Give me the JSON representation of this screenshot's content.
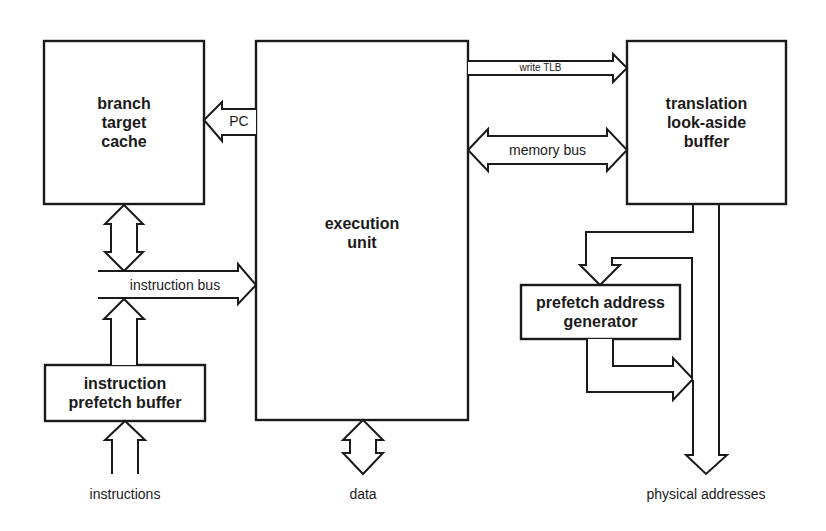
{
  "diagram": {
    "type": "block-diagram",
    "blocks": {
      "branch_target_cache": "branch\ntarget\ncache",
      "branch_target_cache_lines": [
        "branch",
        "target",
        "cache"
      ],
      "execution_unit_lines": [
        "execution",
        "unit"
      ],
      "tlb_lines": [
        "translation",
        "look-aside",
        "buffer"
      ],
      "prefetch_address_generator_lines": [
        "prefetch address",
        "generator"
      ],
      "instruction_prefetch_buffer_lines": [
        "instruction",
        "prefetch buffer"
      ]
    },
    "connections": {
      "pc": "PC",
      "write_tlb": "write TLB",
      "memory_bus": "memory bus",
      "instruction_bus": "instruction bus"
    },
    "external": {
      "instructions": "instructions",
      "data": "data",
      "physical_addresses": "physical addresses"
    },
    "colors": {
      "stroke": "#1a1a1a",
      "background": "#ffffff"
    }
  }
}
